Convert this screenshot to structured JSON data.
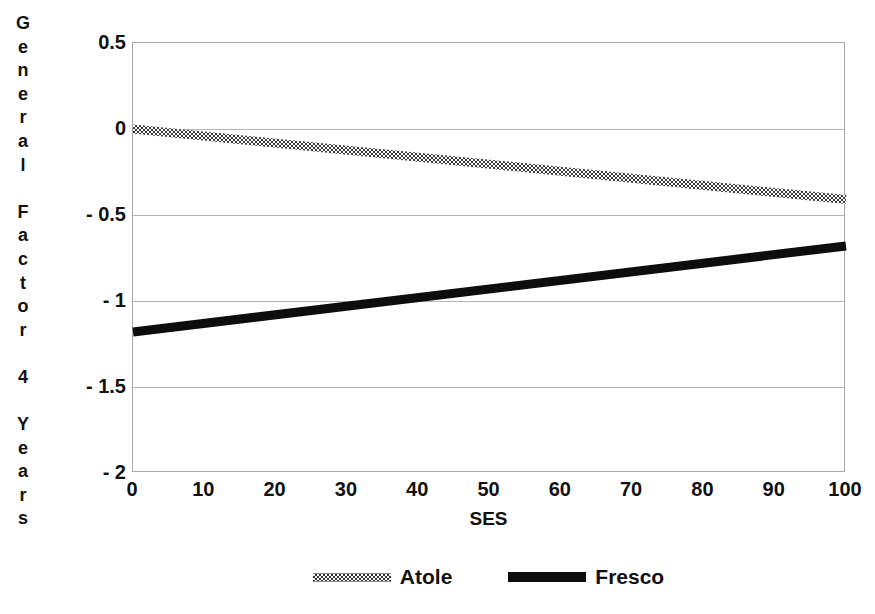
{
  "chart_data": {
    "type": "line",
    "title": "",
    "xlabel": "SES",
    "ylabel": "General Factor 4 Years",
    "xlim": [
      0,
      100
    ],
    "ylim": [
      -2,
      0.5
    ],
    "grid": true,
    "legend_position": "bottom",
    "x_ticks": [
      "0",
      "10",
      "20",
      "30",
      "40",
      "50",
      "60",
      "70",
      "80",
      "90",
      "100"
    ],
    "x_tick_values": [
      0,
      10,
      20,
      30,
      40,
      50,
      60,
      70,
      80,
      90,
      100
    ],
    "y_ticks": [
      "0.5",
      "0",
      "- 0.5",
      "- 1",
      "- 1.5",
      "- 2"
    ],
    "y_tick_values": [
      0.5,
      0,
      -0.5,
      -1,
      -1.5,
      -2
    ],
    "series": [
      {
        "name": "Atole",
        "style": "dithered-gray",
        "color": "#4d4d4d",
        "x": [
          0,
          100
        ],
        "values": [
          0.0,
          -0.41
        ]
      },
      {
        "name": "Fresco",
        "style": "solid-black",
        "color": "#0d0d0d",
        "x": [
          0,
          100
        ],
        "values": [
          -1.18,
          -0.68
        ]
      }
    ],
    "annotations": []
  },
  "y_axis_title_chars": [
    "G",
    "e",
    "n",
    "e",
    "r",
    "a",
    "l",
    " ",
    "F",
    "a",
    "c",
    "t",
    "o",
    "r",
    " ",
    "4",
    " ",
    "Y",
    "e",
    "a",
    "r",
    "s"
  ],
  "legend": {
    "items": [
      {
        "label": "Atole",
        "swatch": "dithered-line-swatch"
      },
      {
        "label": "Fresco",
        "swatch": "solid-line-swatch"
      }
    ]
  },
  "colors": {
    "atole": "#4d4d4d",
    "fresco": "#0d0d0d",
    "gridline": "#b4b4b4",
    "frame": "#a8a8a8",
    "background": "#ffffff",
    "text": "#111111"
  }
}
